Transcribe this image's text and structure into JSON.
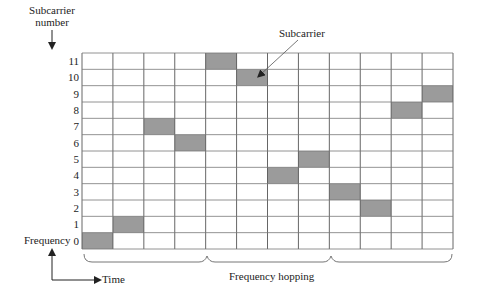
{
  "diagram": {
    "type": "time-frequency grid (frequency hopping)",
    "y_axis_title_line1": "Subcarrier",
    "y_axis_title_line2": "number",
    "row_labels": [
      "11",
      "10",
      "9",
      "8",
      "7",
      "6",
      "5",
      "4",
      "3",
      "2",
      "1",
      "0"
    ],
    "columns": 12,
    "rows": 12,
    "callout_label": "Subcarrier",
    "frequency_axis_label": "Frequency",
    "time_axis_label": "Time",
    "brace_label": "Frequency hopping",
    "hop_sequence": [
      {
        "time_slot": 0,
        "subcarrier": 0
      },
      {
        "time_slot": 1,
        "subcarrier": 1
      },
      {
        "time_slot": 2,
        "subcarrier": 7
      },
      {
        "time_slot": 3,
        "subcarrier": 6
      },
      {
        "time_slot": 4,
        "subcarrier": 11
      },
      {
        "time_slot": 5,
        "subcarrier": 10
      },
      {
        "time_slot": 6,
        "subcarrier": 4
      },
      {
        "time_slot": 7,
        "subcarrier": 5
      },
      {
        "time_slot": 8,
        "subcarrier": 3
      },
      {
        "time_slot": 9,
        "subcarrier": 2
      },
      {
        "time_slot": 10,
        "subcarrier": 8
      },
      {
        "time_slot": 11,
        "subcarrier": 9
      }
    ],
    "colors": {
      "shaded_cell": "#9b9b9b",
      "grid_line": "#555555",
      "text": "#222222"
    }
  }
}
